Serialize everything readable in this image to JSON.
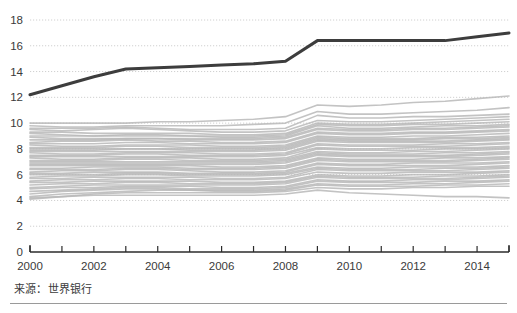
{
  "source_note": "来源：世界银行",
  "axes": {
    "y_ticks": [
      0,
      2,
      4,
      6,
      8,
      10,
      12,
      14,
      16,
      18
    ],
    "y_tick_labels": [
      "0",
      "2",
      "4",
      "6",
      "8",
      "10",
      "12",
      "14",
      "16",
      "18"
    ],
    "x_ticks": [
      2000,
      2001,
      2002,
      2003,
      2004,
      2005,
      2006,
      2007,
      2008,
      2009,
      2010,
      2011,
      2012,
      2013,
      2014,
      2015
    ],
    "x_tick_labels": [
      "2000",
      "",
      "2002",
      "",
      "2004",
      "",
      "2006",
      "",
      "2008",
      "",
      "2010",
      "",
      "2012",
      "",
      "2014",
      ""
    ]
  },
  "colors": {
    "highlight_line": "#3d3d3d",
    "background_line": "#b9b9b9",
    "gridline": "#d0d0d0",
    "axis": "#2b2b2b",
    "text": "#3a3a3a",
    "rule": "#9a9a9a",
    "page_background": "#ffffff"
  },
  "chart_data": {
    "type": "line",
    "title": "",
    "xlabel": "",
    "ylabel": "",
    "xlim": [
      2000,
      2015
    ],
    "ylim": [
      0,
      18
    ],
    "grid": true,
    "legend": "none",
    "x": [
      2000,
      2001,
      2002,
      2003,
      2004,
      2005,
      2006,
      2007,
      2008,
      2009,
      2010,
      2011,
      2012,
      2013,
      2014,
      2015
    ],
    "series": [
      {
        "name": "highlighted",
        "style": "highlight",
        "values": [
          12.2,
          12.9,
          13.6,
          14.2,
          14.3,
          14.4,
          14.5,
          14.6,
          14.8,
          16.4,
          16.4,
          16.4,
          16.4,
          16.4,
          16.7,
          17.0
        ]
      },
      {
        "name": "background-01",
        "style": "background",
        "values": [
          10.0,
          10.0,
          10.0,
          10.0,
          10.1,
          10.1,
          10.2,
          10.3,
          10.5,
          11.4,
          11.3,
          11.4,
          11.6,
          11.7,
          11.9,
          12.1
        ]
      },
      {
        "name": "background-02",
        "style": "background",
        "values": [
          9.8,
          9.7,
          9.7,
          9.8,
          9.8,
          9.8,
          9.8,
          9.9,
          10.0,
          10.9,
          10.7,
          10.7,
          10.8,
          10.9,
          11.0,
          11.2
        ]
      },
      {
        "name": "background-03",
        "style": "background",
        "values": [
          9.6,
          9.6,
          9.6,
          9.7,
          9.6,
          9.5,
          9.5,
          9.5,
          9.6,
          10.6,
          10.4,
          10.4,
          10.5,
          10.5,
          10.6,
          10.7
        ]
      },
      {
        "name": "background-04",
        "style": "background",
        "values": [
          9.5,
          9.4,
          9.5,
          9.6,
          9.5,
          9.4,
          9.3,
          9.3,
          9.4,
          10.2,
          10.1,
          10.1,
          10.2,
          10.3,
          10.4,
          10.5
        ]
      },
      {
        "name": "background-05",
        "style": "background",
        "values": [
          9.3,
          9.3,
          9.2,
          9.2,
          9.2,
          9.2,
          9.1,
          9.1,
          9.2,
          10.0,
          9.9,
          9.9,
          10.0,
          10.1,
          10.2,
          10.3
        ]
      },
      {
        "name": "background-06",
        "style": "background",
        "values": [
          9.2,
          9.1,
          9.0,
          9.0,
          9.0,
          9.0,
          9.0,
          9.0,
          9.1,
          9.9,
          9.8,
          9.8,
          9.9,
          9.9,
          10.0,
          10.1
        ]
      },
      {
        "name": "background-07",
        "style": "background",
        "values": [
          9.0,
          9.0,
          9.0,
          9.1,
          9.1,
          9.0,
          8.9,
          8.9,
          9.0,
          9.8,
          9.6,
          9.6,
          9.7,
          9.8,
          9.8,
          9.9
        ]
      },
      {
        "name": "background-08",
        "style": "background",
        "values": [
          8.9,
          8.8,
          8.8,
          8.8,
          8.8,
          8.8,
          8.8,
          8.8,
          8.9,
          9.6,
          9.5,
          9.5,
          9.6,
          9.6,
          9.7,
          9.8
        ]
      },
      {
        "name": "background-09",
        "style": "background",
        "values": [
          8.7,
          8.7,
          8.7,
          8.8,
          8.8,
          8.7,
          8.7,
          8.7,
          8.8,
          9.5,
          9.4,
          9.4,
          9.5,
          9.5,
          9.6,
          9.7
        ]
      },
      {
        "name": "background-10",
        "style": "background",
        "values": [
          8.5,
          8.6,
          8.6,
          8.7,
          8.6,
          8.6,
          8.5,
          8.5,
          8.6,
          9.3,
          9.2,
          9.2,
          9.3,
          9.3,
          9.4,
          9.5
        ]
      },
      {
        "name": "background-11",
        "style": "background",
        "values": [
          8.4,
          8.4,
          8.4,
          8.5,
          8.5,
          8.4,
          8.4,
          8.4,
          8.5,
          9.2,
          9.1,
          9.1,
          9.2,
          9.2,
          9.3,
          9.4
        ]
      },
      {
        "name": "background-12",
        "style": "background",
        "values": [
          8.3,
          8.2,
          8.2,
          8.3,
          8.3,
          8.3,
          8.2,
          8.2,
          8.3,
          9.0,
          8.9,
          8.9,
          9.0,
          9.0,
          9.1,
          9.2
        ]
      },
      {
        "name": "background-13",
        "style": "background",
        "values": [
          8.1,
          8.1,
          8.1,
          8.2,
          8.2,
          8.1,
          8.1,
          8.1,
          8.2,
          8.9,
          8.8,
          8.8,
          8.8,
          8.9,
          8.9,
          9.0
        ]
      },
      {
        "name": "background-14",
        "style": "background",
        "values": [
          8.0,
          8.0,
          8.0,
          8.0,
          8.0,
          8.0,
          8.0,
          8.0,
          8.1,
          8.8,
          8.7,
          8.7,
          8.7,
          8.8,
          8.8,
          8.9
        ]
      },
      {
        "name": "background-15",
        "style": "background",
        "values": [
          7.9,
          7.9,
          7.9,
          8.0,
          8.0,
          7.9,
          7.9,
          7.9,
          8.0,
          8.7,
          8.6,
          8.6,
          8.6,
          8.6,
          8.7,
          8.8
        ]
      },
      {
        "name": "background-16",
        "style": "background",
        "values": [
          7.8,
          7.8,
          7.8,
          7.8,
          7.8,
          7.8,
          7.8,
          7.8,
          7.9,
          8.6,
          8.5,
          8.5,
          8.5,
          8.5,
          8.6,
          8.7
        ]
      },
      {
        "name": "background-17",
        "style": "background",
        "values": [
          7.7,
          7.6,
          7.6,
          7.7,
          7.7,
          7.7,
          7.6,
          7.6,
          7.7,
          8.4,
          8.3,
          8.3,
          8.3,
          8.4,
          8.4,
          8.5
        ]
      },
      {
        "name": "background-18",
        "style": "background",
        "values": [
          7.5,
          7.5,
          7.5,
          7.6,
          7.6,
          7.5,
          7.5,
          7.5,
          7.6,
          8.3,
          8.2,
          8.2,
          8.2,
          8.2,
          8.3,
          8.4
        ]
      },
      {
        "name": "background-19",
        "style": "background",
        "values": [
          7.4,
          7.4,
          7.4,
          7.4,
          7.4,
          7.4,
          7.4,
          7.4,
          7.5,
          8.1,
          8.0,
          8.0,
          8.1,
          8.1,
          8.1,
          8.2
        ]
      },
      {
        "name": "background-20",
        "style": "background",
        "values": [
          7.3,
          7.2,
          7.2,
          7.3,
          7.3,
          7.3,
          7.2,
          7.2,
          7.3,
          8.0,
          7.9,
          7.9,
          7.9,
          8.0,
          8.0,
          8.1
        ]
      },
      {
        "name": "background-21",
        "style": "background",
        "values": [
          7.1,
          7.1,
          7.1,
          7.2,
          7.2,
          7.1,
          7.1,
          7.1,
          7.2,
          7.8,
          7.7,
          7.7,
          7.8,
          7.8,
          7.9,
          8.0
        ]
      },
      {
        "name": "background-22",
        "style": "background",
        "values": [
          7.0,
          7.0,
          7.0,
          7.0,
          7.0,
          7.0,
          7.0,
          7.0,
          7.1,
          7.7,
          7.6,
          7.6,
          7.6,
          7.7,
          7.7,
          7.8
        ]
      },
      {
        "name": "background-23",
        "style": "background",
        "values": [
          6.9,
          6.9,
          6.9,
          6.9,
          6.9,
          6.9,
          6.9,
          6.9,
          7.0,
          7.6,
          7.5,
          7.5,
          7.5,
          7.5,
          7.6,
          7.7
        ]
      },
      {
        "name": "background-24",
        "style": "background",
        "values": [
          6.8,
          6.8,
          6.8,
          6.8,
          6.8,
          6.8,
          6.8,
          6.8,
          6.9,
          7.5,
          7.4,
          7.4,
          7.4,
          7.4,
          7.5,
          7.6
        ]
      },
      {
        "name": "background-25",
        "style": "background",
        "values": [
          6.7,
          6.7,
          6.7,
          6.7,
          6.7,
          6.7,
          6.6,
          6.6,
          6.7,
          7.3,
          7.2,
          7.2,
          7.2,
          7.3,
          7.3,
          7.4
        ]
      },
      {
        "name": "background-26",
        "style": "background",
        "values": [
          6.5,
          6.5,
          6.6,
          6.6,
          6.6,
          6.5,
          6.5,
          6.5,
          6.6,
          7.2,
          7.1,
          7.1,
          7.1,
          7.1,
          7.2,
          7.3
        ]
      },
      {
        "name": "background-27",
        "style": "background",
        "values": [
          6.4,
          6.4,
          6.4,
          6.5,
          6.5,
          6.4,
          6.4,
          6.4,
          6.5,
          7.1,
          7.0,
          7.0,
          7.0,
          7.0,
          7.1,
          7.2
        ]
      },
      {
        "name": "background-28",
        "style": "background",
        "values": [
          6.2,
          6.3,
          6.3,
          6.4,
          6.4,
          6.3,
          6.2,
          6.2,
          6.3,
          6.9,
          6.8,
          6.8,
          6.9,
          6.9,
          6.9,
          7.0
        ]
      },
      {
        "name": "background-29",
        "style": "background",
        "values": [
          6.1,
          6.1,
          6.2,
          6.2,
          6.2,
          6.1,
          6.1,
          6.1,
          6.2,
          6.8,
          6.7,
          6.7,
          6.7,
          6.7,
          6.8,
          6.9
        ]
      },
      {
        "name": "background-30",
        "style": "background",
        "values": [
          6.0,
          6.0,
          6.0,
          6.1,
          6.1,
          6.0,
          6.0,
          6.0,
          6.1,
          6.6,
          6.5,
          6.5,
          6.6,
          6.6,
          6.6,
          6.7
        ]
      },
      {
        "name": "background-31",
        "style": "background",
        "values": [
          5.8,
          5.9,
          5.9,
          6.0,
          6.0,
          5.9,
          5.9,
          5.9,
          6.0,
          6.5,
          6.4,
          6.4,
          6.4,
          6.5,
          6.5,
          6.6
        ]
      },
      {
        "name": "background-32",
        "style": "background",
        "values": [
          5.7,
          5.7,
          5.8,
          5.8,
          5.8,
          5.8,
          5.7,
          5.7,
          5.8,
          6.4,
          6.3,
          6.3,
          6.3,
          6.3,
          6.4,
          6.5
        ]
      },
      {
        "name": "background-33",
        "style": "background",
        "values": [
          5.5,
          5.6,
          5.6,
          5.7,
          5.7,
          5.6,
          5.6,
          5.6,
          5.7,
          6.2,
          6.1,
          6.1,
          6.2,
          6.2,
          6.2,
          6.3
        ]
      },
      {
        "name": "background-34",
        "style": "background",
        "values": [
          5.4,
          5.4,
          5.5,
          5.5,
          5.5,
          5.5,
          5.4,
          5.4,
          5.5,
          6.0,
          5.9,
          5.9,
          6.0,
          6.0,
          6.1,
          6.2
        ]
      },
      {
        "name": "background-35",
        "style": "background",
        "values": [
          5.2,
          5.3,
          5.3,
          5.4,
          5.4,
          5.3,
          5.3,
          5.3,
          5.4,
          5.9,
          5.8,
          5.8,
          5.8,
          5.9,
          5.9,
          6.0
        ]
      },
      {
        "name": "background-36",
        "style": "background",
        "values": [
          5.0,
          5.1,
          5.2,
          5.2,
          5.2,
          5.2,
          5.2,
          5.2,
          5.3,
          5.8,
          5.7,
          5.7,
          5.7,
          5.7,
          5.8,
          5.9
        ]
      },
      {
        "name": "background-37",
        "style": "background",
        "values": [
          4.9,
          5.0,
          5.0,
          5.1,
          5.1,
          5.1,
          5.0,
          5.0,
          5.1,
          5.6,
          5.5,
          5.5,
          5.6,
          5.6,
          5.7,
          5.8
        ]
      },
      {
        "name": "background-38",
        "style": "background",
        "values": [
          4.7,
          4.8,
          4.9,
          5.0,
          5.0,
          4.9,
          4.9,
          4.9,
          5.0,
          5.5,
          5.4,
          5.4,
          5.4,
          5.5,
          5.5,
          5.6
        ]
      },
      {
        "name": "background-39",
        "style": "background",
        "values": [
          4.5,
          4.7,
          4.8,
          4.9,
          4.9,
          4.8,
          4.8,
          4.8,
          4.9,
          5.3,
          5.2,
          5.2,
          5.3,
          5.3,
          5.4,
          5.5
        ]
      },
      {
        "name": "background-40",
        "style": "background",
        "values": [
          4.3,
          4.5,
          4.6,
          4.7,
          4.8,
          4.8,
          4.7,
          4.7,
          4.8,
          5.2,
          5.1,
          5.1,
          5.1,
          5.2,
          5.2,
          5.3
        ]
      },
      {
        "name": "background-41",
        "style": "background",
        "values": [
          4.1,
          4.3,
          4.5,
          4.6,
          4.6,
          4.6,
          4.6,
          4.6,
          4.7,
          5.0,
          4.9,
          4.9,
          5.0,
          5.0,
          5.1,
          5.1
        ]
      },
      {
        "name": "background-42",
        "style": "background",
        "values": [
          4.2,
          4.3,
          4.4,
          4.4,
          4.4,
          4.4,
          4.4,
          4.4,
          4.5,
          4.8,
          4.6,
          4.5,
          4.4,
          4.3,
          4.3,
          4.2
        ]
      }
    ]
  }
}
